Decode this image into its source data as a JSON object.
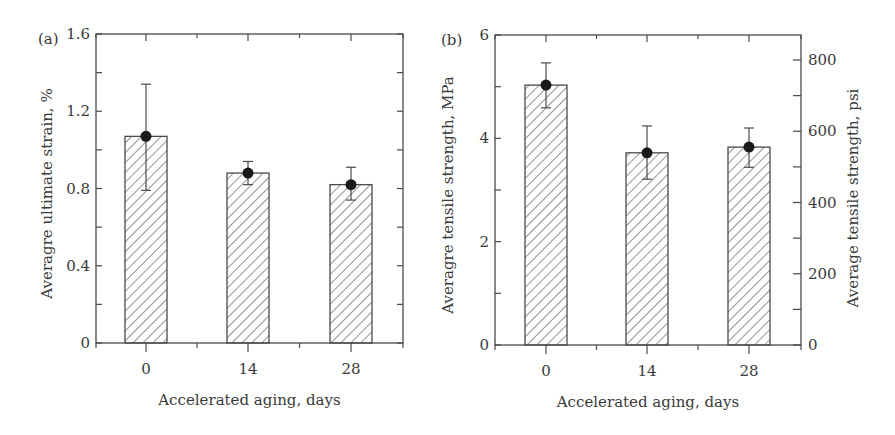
{
  "figure": {
    "colors": {
      "ink": "#3a3a3a",
      "axis": "#4a4a4a",
      "hatch": "#5a5a5a",
      "marker": "#1a1a1a",
      "background": "#ffffff"
    }
  },
  "chart_data": [
    {
      "type": "bar",
      "panel_label": "(a)",
      "title": "",
      "categories": [
        "0",
        "14",
        "28"
      ],
      "values": [
        1.07,
        0.88,
        0.82
      ],
      "error_upper": [
        1.34,
        0.94,
        0.91
      ],
      "error_lower": [
        0.79,
        0.82,
        0.74
      ],
      "xlabel": "Accelerated aging, days",
      "ylabel": "Averagre ultimate strain, %",
      "ylim": [
        0,
        1.6
      ],
      "yticks": [
        "0",
        "0.4",
        "0.8",
        "1.2",
        "1.6"
      ],
      "ytick_values": [
        0,
        0.4,
        0.8,
        1.2,
        1.6
      ],
      "yminor_step": 0.2,
      "bar_fill": "diagonal hatch",
      "markers": "filled circle with error bars",
      "grid": false,
      "legend": null
    },
    {
      "type": "bar",
      "panel_label": "(b)",
      "title": "",
      "categories": [
        "0",
        "14",
        "28"
      ],
      "values": [
        5.03,
        3.72,
        3.83
      ],
      "error_upper": [
        5.46,
        4.24,
        4.2
      ],
      "error_lower": [
        4.59,
        3.21,
        3.44
      ],
      "xlabel": "Accelerated aging, days",
      "ylabel": "Averagre tensile strength, MPa",
      "ylim": [
        0,
        6
      ],
      "yticks": [
        "0",
        "2",
        "4",
        "6"
      ],
      "ytick_values": [
        0,
        2,
        4,
        6
      ],
      "yminor_step": 1,
      "y2label": "Average tensile strength, psi",
      "y2lim": [
        0,
        870.2
      ],
      "y2ticks": [
        "0",
        "200",
        "400",
        "600",
        "800"
      ],
      "y2tick_values": [
        0,
        200,
        400,
        600,
        800
      ],
      "y2minor_step": 100,
      "bar_fill": "diagonal hatch",
      "markers": "filled circle with error bars",
      "grid": false,
      "legend": null
    }
  ],
  "layout": {
    "panels": [
      {
        "left": 96,
        "right": 403,
        "top": 34,
        "bottom": 343,
        "xpos": [
          146,
          248,
          351
        ],
        "bar_width": 42,
        "ylabel_x": 52,
        "xlabel_y": 400,
        "panel_label_x": 38,
        "panel_label_y": 39
      },
      {
        "left": 495,
        "right": 801,
        "top": 35,
        "bottom": 345,
        "xpos": [
          546,
          647,
          749
        ],
        "bar_width": 42,
        "ylabel_x": 453,
        "xlabel_y": 402,
        "panel_label_x": 441,
        "panel_label_y": 40,
        "y2label_x": 858
      }
    ]
  }
}
